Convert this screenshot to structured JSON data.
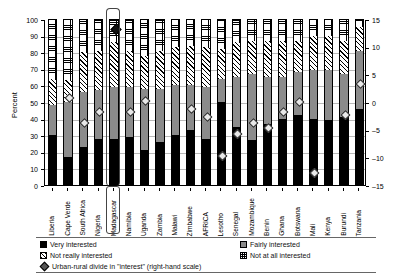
{
  "chart_data": {
    "type": "bar",
    "subtype": "stacked-bar-with-overlay-line-markers",
    "title": "",
    "xlabel": "",
    "ylabel": "Percent",
    "ylabel_right": "",
    "ylim": [
      0,
      100
    ],
    "ylim_right": [
      -15,
      15
    ],
    "yticks": [
      0,
      10,
      20,
      30,
      40,
      50,
      60,
      70,
      80,
      90,
      100
    ],
    "yticks_right": [
      -15,
      -10,
      -5,
      0,
      5,
      10,
      15
    ],
    "grid": true,
    "legend_position": "bottom",
    "highlight_category": "Madagascar",
    "categories": [
      "Liberia",
      "Cape Verde",
      "South Africa",
      "Nigeria",
      "Madagascar",
      "Namibia",
      "Uganda",
      "Zambia",
      "Malawi",
      "Zimbabwe",
      "AFRICA",
      "Lesotho",
      "Senegal",
      "Mozambique",
      "Benin",
      "Ghana",
      "Botswana",
      "Mali",
      "Kenya",
      "Burundi",
      "Tanzania"
    ],
    "series": [
      {
        "name": "Very interested",
        "key": "very",
        "values": [
          30,
          17,
          23,
          28,
          28,
          29,
          21,
          26,
          30,
          33,
          28,
          50,
          35,
          27,
          37,
          40,
          42,
          40,
          39,
          41,
          46
        ]
      },
      {
        "name": "Fairly interested",
        "key": "fairly",
        "values": [
          18,
          33,
          33,
          29,
          31,
          30,
          37,
          32,
          30,
          27,
          31,
          14,
          30,
          40,
          28,
          25,
          26,
          29,
          30,
          26,
          35
        ]
      },
      {
        "name": "Not really interested",
        "key": "notreally",
        "values": [
          16,
          13,
          24,
          24,
          27,
          22,
          20,
          23,
          23,
          24,
          24,
          18,
          21,
          20,
          22,
          22,
          19,
          21,
          21,
          20,
          14
        ]
      },
      {
        "name": "Not at all interested",
        "key": "notatall",
        "values": [
          36,
          37,
          20,
          19,
          14,
          19,
          22,
          19,
          17,
          16,
          17,
          18,
          14,
          13,
          13,
          13,
          13,
          10,
          10,
          13,
          5
        ]
      }
    ],
    "overlay": {
      "name": "Urban-rural divide in \"interest\" (right-hand scale)",
      "marker": "diamond",
      "scale": "right",
      "values": [
        null,
        1.0,
        -3.5,
        -1.5,
        13.5,
        -1.5,
        0.5,
        null,
        null,
        -1.0,
        -2.5,
        -9.5,
        -5.5,
        -3.5,
        -4.5,
        -1.5,
        0.3,
        -12.5,
        null,
        -2.0,
        3.5
      ]
    }
  },
  "axes": {
    "left_title": "Percent",
    "left_ticks": [
      "100",
      "90",
      "80",
      "70",
      "60",
      "50",
      "40",
      "30",
      "20",
      "10",
      "0"
    ],
    "right_ticks": [
      "15",
      "10",
      "5",
      "0",
      "-5",
      "-10",
      "-15"
    ]
  },
  "legend": {
    "items": [
      {
        "label": "Very interested",
        "swatch": "black-square-icon"
      },
      {
        "label": "Fairly interested",
        "swatch": "grey-square-icon"
      },
      {
        "label": "Not really interested",
        "swatch": "hatched-square-icon"
      },
      {
        "label": "Not at all interested",
        "swatch": "checkered-square-icon"
      },
      {
        "label": "Urban-rural divide in \"interest\" (right-hand scale)",
        "swatch": "diamond-marker-icon"
      }
    ]
  }
}
